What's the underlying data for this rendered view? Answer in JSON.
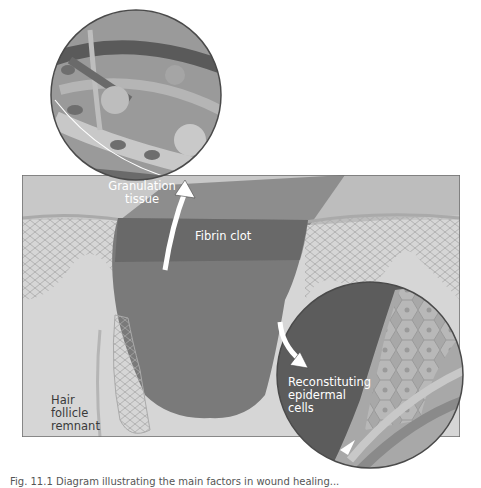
{
  "figure": {
    "labels": {
      "granulation_tissue": [
        "Granulation",
        "tissue"
      ],
      "fibrin_clot": "Fibrin clot",
      "hair_follicle_remnant": [
        "Hair",
        "follicle",
        "remnant"
      ],
      "reconstituting_epidermal_cells": [
        "Reconstituting",
        "epidermal",
        "cells"
      ]
    },
    "caption": "Fig. 11.1 Diagram illustrating the main factors in wound healing..."
  },
  "colors": {
    "dermis": "#d4d4d4",
    "clot": "#7a7a7a",
    "clot_dark": "#555555",
    "epidermis": "#c2c2c2",
    "panel_border": "#6e6e6e",
    "inset_bg": "#8c8c8c",
    "arrow": "#ffffff"
  }
}
